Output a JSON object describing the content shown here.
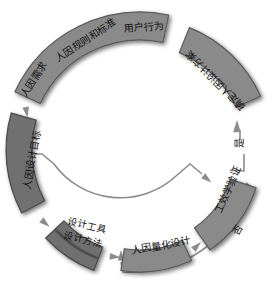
{
  "diagram": {
    "title": "",
    "nodes": {
      "top_arc": {
        "items": [
          "人因需求",
          "人因规则和标准",
          "用户行为"
        ]
      },
      "right_arc": {
        "label": "确定人因设计方案"
      },
      "left_box": {
        "label": "人因设计目标"
      },
      "tools_box": {
        "label": "设计工具"
      },
      "methods_box": {
        "label": "设计方法"
      },
      "quant_box": {
        "label": "人因量化设计"
      },
      "verify_box": {
        "label": "工效学验证"
      }
    },
    "decision_labels": {
      "yes": "是",
      "no": "否"
    },
    "colors": {
      "segment_fill": "#8a8a8a",
      "segment_stroke": "#5a5a5a",
      "flow_line": "#8c8c8c",
      "text": "#111111",
      "background": "#ffffff"
    }
  }
}
